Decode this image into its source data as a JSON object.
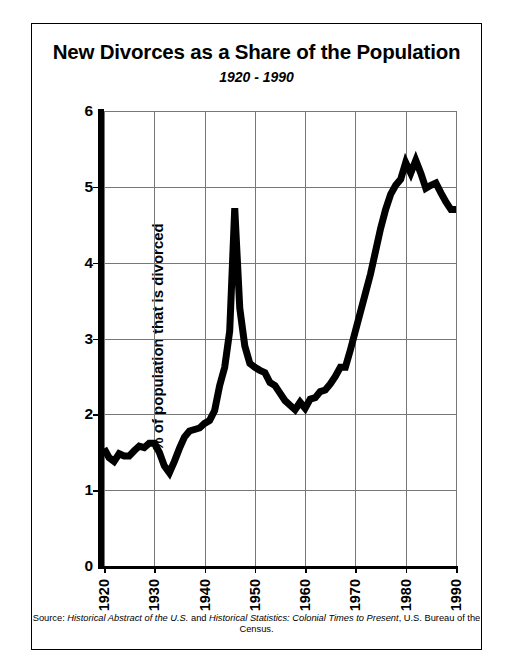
{
  "chart_data": {
    "type": "line",
    "title": "New Divorces as a Share of the Population",
    "subtitle": "1920 - 1990",
    "xlabel": "",
    "ylabel": "% of population that is divorced",
    "xlim": [
      1920,
      1990
    ],
    "ylim": [
      0,
      6
    ],
    "yticks": [
      0,
      1,
      2,
      3,
      4,
      5,
      6
    ],
    "xticks": [
      1920,
      1930,
      1940,
      1950,
      1960,
      1970,
      1980,
      1990
    ],
    "ytick_labels": [
      "0",
      "1",
      "2",
      "3",
      "4",
      "5",
      "6"
    ],
    "xtick_labels": [
      "1920",
      "1930",
      "1940",
      "1950",
      "1960",
      "1970",
      "1980",
      "1990"
    ],
    "grid": true,
    "grid_color": "#777777",
    "legend": false,
    "line_color": "#000000",
    "line_width": 7,
    "series": [
      {
        "name": "New divorces as a share of the population",
        "x": [
          1920,
          1921,
          1922,
          1923,
          1924,
          1925,
          1926,
          1927,
          1928,
          1929,
          1930,
          1931,
          1932,
          1933,
          1934,
          1935,
          1936,
          1937,
          1938,
          1939,
          1940,
          1941,
          1942,
          1943,
          1944,
          1945,
          1946,
          1947,
          1948,
          1949,
          1950,
          1951,
          1952,
          1953,
          1954,
          1955,
          1956,
          1957,
          1958,
          1959,
          1960,
          1961,
          1962,
          1963,
          1964,
          1965,
          1966,
          1967,
          1968,
          1969,
          1970,
          1971,
          1972,
          1973,
          1974,
          1975,
          1976,
          1977,
          1978,
          1979,
          1980,
          1981,
          1982,
          1983,
          1984,
          1985,
          1986,
          1987,
          1988,
          1989,
          1990
        ],
        "y": [
          1.55,
          1.43,
          1.38,
          1.48,
          1.45,
          1.45,
          1.52,
          1.58,
          1.56,
          1.62,
          1.62,
          1.5,
          1.32,
          1.23,
          1.38,
          1.55,
          1.7,
          1.78,
          1.8,
          1.82,
          1.88,
          1.92,
          2.05,
          2.38,
          2.62,
          3.1,
          4.72,
          3.4,
          2.9,
          2.67,
          2.62,
          2.58,
          2.55,
          2.42,
          2.38,
          2.28,
          2.18,
          2.12,
          2.06,
          2.16,
          2.08,
          2.2,
          2.22,
          2.3,
          2.32,
          2.4,
          2.5,
          2.62,
          2.62,
          2.85,
          3.1,
          3.35,
          3.6,
          3.85,
          4.15,
          4.45,
          4.7,
          4.9,
          5.02,
          5.1,
          5.32,
          5.18,
          5.35,
          5.18,
          4.98,
          5.02,
          5.05,
          4.92,
          4.8,
          4.7,
          4.7
        ]
      }
    ],
    "annotations": []
  },
  "figure": {
    "source_prefix": "Source: ",
    "source_italic_1": "Historical Abstract of the U.S.",
    "source_mid": " and ",
    "source_italic_2": "Historical Statistics: Colonial Times to Present",
    "source_suffix": ", U.S. Bureau of the Census."
  }
}
